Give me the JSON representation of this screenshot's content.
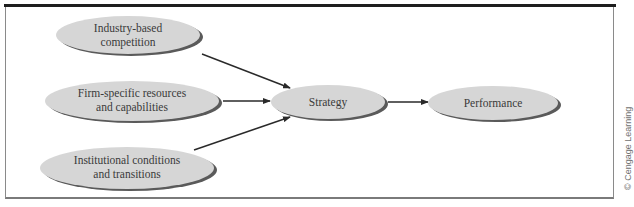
{
  "figure": {
    "credit": "© Cengage Learning",
    "colors": {
      "node_fill": "#d6d6d6",
      "node_shadow": "#5a5a5a",
      "arrow": "#2a2a2a",
      "text": "#3a3a3a",
      "frame_top": "#1e1e1e"
    }
  },
  "nodes": {
    "industry": {
      "line1": "Industry-based",
      "line2": "competition"
    },
    "firm": {
      "line1": "Firm-specific resources",
      "line2": "and capabilities"
    },
    "institutional": {
      "line1": "Institutional conditions",
      "line2": "and transitions"
    },
    "strategy": {
      "label": "Strategy"
    },
    "performance": {
      "label": "Performance"
    }
  },
  "edges": [
    {
      "from": "Industry-based competition",
      "to": "Strategy"
    },
    {
      "from": "Firm-specific resources and capabilities",
      "to": "Strategy"
    },
    {
      "from": "Institutional conditions and transitions",
      "to": "Strategy"
    },
    {
      "from": "Strategy",
      "to": "Performance"
    }
  ]
}
